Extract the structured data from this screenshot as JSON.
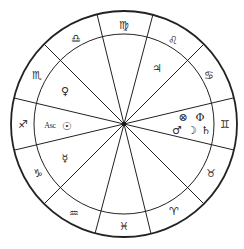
{
  "chart": {
    "type": "astrological-natal-wheel",
    "center": [
      124,
      124
    ],
    "outer_radius": 113,
    "inner_radius": 90,
    "line_color": "#222222",
    "background": "#ffffff",
    "house_cusp_angles_deg": [
      -166.7,
      -135,
      -103.8,
      -75.2,
      -45,
      -13.4,
      13.3,
      45,
      76.2,
      104.8,
      135,
      166.6
    ]
  },
  "signs": [
    {
      "name": "Gemini",
      "glyph": "♊",
      "pos": [
        225,
        124
      ]
    },
    {
      "name": "Taurus",
      "glyph": "♉",
      "pos": [
        211,
        173
      ]
    },
    {
      "name": "Aries",
      "glyph": "♈",
      "pos": [
        174,
        211
      ]
    },
    {
      "name": "Pisces",
      "glyph": "♓",
      "pos": [
        124,
        226
      ]
    },
    {
      "name": "Aquarius",
      "glyph": "♒",
      "pos": [
        74,
        213
      ]
    },
    {
      "name": "Capricorn",
      "glyph": "♑",
      "pos": [
        38,
        173
      ]
    },
    {
      "name": "Sagittarius",
      "glyph": "♐",
      "pos": [
        23,
        124
      ]
    },
    {
      "name": "Scorpio",
      "glyph": "♏",
      "pos": [
        37,
        75
      ]
    },
    {
      "name": "Libra",
      "glyph": "♎",
      "pos": [
        76,
        38
      ]
    },
    {
      "name": "Virgo",
      "glyph": "♍",
      "pos": [
        124,
        25
      ]
    },
    {
      "name": "Leo",
      "glyph": "♌",
      "pos": [
        173,
        40
      ]
    },
    {
      "name": "Cancer",
      "glyph": "♋",
      "pos": [
        209,
        75
      ]
    }
  ],
  "planets": [
    {
      "name": "Jupiter",
      "glyph": "♃",
      "pos": [
        157,
        68
      ]
    },
    {
      "name": "Venus",
      "glyph": "♀",
      "pos": [
        65,
        91
      ]
    },
    {
      "name": "Sun",
      "glyph": "☉",
      "pos": [
        67,
        126
      ]
    },
    {
      "name": "Mercury",
      "glyph": "☿",
      "pos": [
        65,
        158
      ]
    },
    {
      "name": "Part of Fortune",
      "glyph": "⊗",
      "pos": [
        183,
        117
      ]
    },
    {
      "name": "Uranus",
      "glyph": "Φ",
      "pos": [
        200,
        117
      ]
    },
    {
      "name": "Mars",
      "glyph": "♂",
      "pos": [
        177,
        130
      ]
    },
    {
      "name": "Moon",
      "glyph": "☽",
      "pos": [
        192,
        130
      ]
    },
    {
      "name": "Saturn",
      "glyph": "♄",
      "pos": [
        206,
        130
      ]
    }
  ],
  "ascendant": {
    "label": "Asc",
    "pos": [
      50,
      126
    ]
  }
}
